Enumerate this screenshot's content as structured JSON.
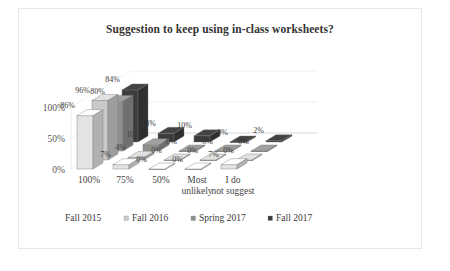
{
  "chart_data": {
    "type": "bar",
    "title": "Suggestion to keep using in-class worksheets?",
    "xlabel": "",
    "ylabel": "",
    "ylim": [
      0,
      100
    ],
    "yticks": [
      "0%",
      "50%",
      "100%"
    ],
    "grid": true,
    "three_d": true,
    "legend_position": "bottom",
    "categories": [
      "100%",
      "75%",
      "50%",
      "Most unlikely",
      "I do not suggest"
    ],
    "series": [
      {
        "name": "Fall 2015",
        "color": "#e3e3e3",
        "values": [
          86,
          7,
          0,
          0,
          7
        ],
        "labels": [
          "86%",
          "7%",
          "0%",
          "0%",
          "7%"
        ]
      },
      {
        "name": "Fall 2016",
        "color": "#c9c9c9",
        "values": [
          96,
          4,
          0,
          0,
          0
        ],
        "labels": [
          "96%",
          "4%",
          "0%",
          "0%",
          "0%"
        ]
      },
      {
        "name": "Spring 2017",
        "color": "#8f8f8f",
        "values": [
          80,
          10,
          0,
          0,
          0
        ],
        "labels": [
          "80%",
          "10%",
          "0%",
          "0%",
          "0%"
        ]
      },
      {
        "name": "Fall 2017",
        "color": "#3c3c3c",
        "values": [
          84,
          14,
          10,
          0,
          2
        ],
        "labels": [
          "84%",
          "14%",
          "10%",
          "0%",
          "2%"
        ]
      }
    ]
  },
  "legend": {
    "items": [
      {
        "label": "Fall 2015"
      },
      {
        "label": "Fall 2016"
      },
      {
        "label": "Spring 2017"
      },
      {
        "label": "Fall 2017"
      }
    ]
  }
}
